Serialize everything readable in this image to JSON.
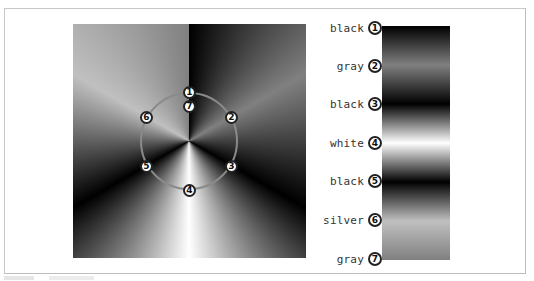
{
  "figure": {
    "gradient_type": "conic",
    "center_badges": [
      {
        "number": "1",
        "angle_deg": 0
      },
      {
        "number": "2",
        "angle_deg": 60
      },
      {
        "number": "3",
        "angle_deg": 120
      },
      {
        "number": "4",
        "angle_deg": 180
      },
      {
        "number": "5",
        "angle_deg": 240
      },
      {
        "number": "6",
        "angle_deg": 300
      },
      {
        "number": "7",
        "angle_deg": 360
      }
    ],
    "stops": [
      {
        "number": "1",
        "label": "black",
        "color": "#000000"
      },
      {
        "number": "2",
        "label": "gray",
        "color": "#808080"
      },
      {
        "number": "3",
        "label": "black",
        "color": "#000000"
      },
      {
        "number": "4",
        "label": "white",
        "color": "#ffffff"
      },
      {
        "number": "5",
        "label": "black",
        "color": "#000000"
      },
      {
        "number": "6",
        "label": "silver",
        "color": "#c0c0c0"
      },
      {
        "number": "7",
        "label": "gray",
        "color": "#808080"
      }
    ],
    "ring_color": "#8a8a8a",
    "frame_border_color": "#c8c8c8"
  }
}
